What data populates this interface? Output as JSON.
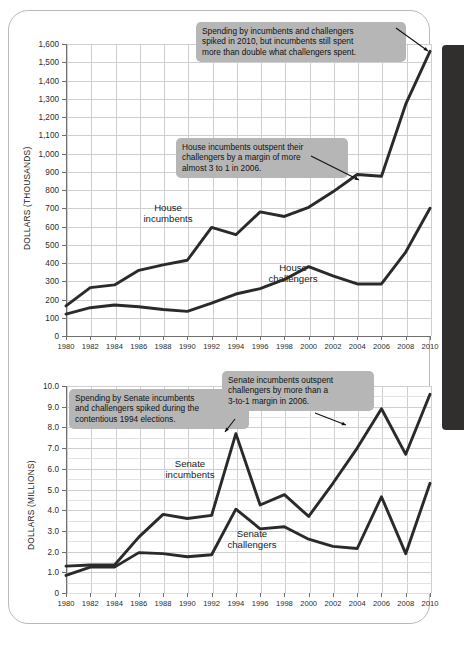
{
  "page": {
    "side_tab_color": "#302f2d",
    "card_border_color": "#b9b9b9"
  },
  "charts": [
    {
      "id": "house",
      "axis": {
        "ylabel": "DOLLARS (THOUSANDS)"
      },
      "series_labels": [
        {
          "name": "house-incumbents-label",
          "line1": "House",
          "line2": "incumbents"
        },
        {
          "name": "house-challengers-label",
          "line1": "House",
          "line2": "challengers"
        }
      ],
      "callouts": [
        {
          "name": "callout-2010-spike",
          "line1": "Spending by incumbents and challengers",
          "line2": "spiked in 2010, but incumbents still spent",
          "line3": "more than double what challengers spent."
        },
        {
          "name": "callout-house-2006-margin",
          "line1": "House incumbents outspent their",
          "line2": "challengers by a margin of more",
          "line3": "almost 3 to 1 in 2006."
        }
      ]
    },
    {
      "id": "senate",
      "axis": {
        "ylabel": "DOLLARS (MILLIONS)"
      },
      "series_labels": [
        {
          "name": "senate-incumbents-label",
          "line1": "Senate",
          "line2": "incumbents"
        },
        {
          "name": "senate-challengers-label",
          "line1": "Senate",
          "line2": "challengers"
        }
      ],
      "callouts": [
        {
          "name": "callout-senate-1994-spike",
          "line1": "Spending by Senate incumbents",
          "line2": "and challengers spiked during the",
          "line3": "contentious 1994 elections."
        },
        {
          "name": "callout-senate-2006-margin",
          "line1": "Senate incumbents outspent",
          "line2": "challengers by more than a",
          "line3": "3-to-1 margin in 2006."
        }
      ]
    }
  ],
  "chart_data": [
    {
      "type": "line",
      "title": "",
      "xlabel": "",
      "ylabel": "DOLLARS (THOUSANDS)",
      "x": [
        1980,
        1982,
        1984,
        1986,
        1988,
        1990,
        1992,
        1994,
        1996,
        1998,
        2000,
        2002,
        2004,
        2006,
        2008,
        2010
      ],
      "xtick_labels": [
        "1980",
        "1982",
        "1984",
        "1986",
        "1988",
        "1990",
        "1992",
        "1994",
        "1996",
        "1998",
        "2000",
        "2002",
        "2004",
        "2006",
        "2008",
        "2010"
      ],
      "ytick_labels": [
        "0",
        "100",
        "200",
        "300",
        "400",
        "500",
        "600",
        "700",
        "800",
        "900",
        "1,000",
        "1,100",
        "1,200",
        "1,300",
        "1,400",
        "1,500",
        "1,600"
      ],
      "ylim": [
        0,
        1600
      ],
      "ytick_step": 100,
      "grid": true,
      "legend": "inline-labels",
      "series": [
        {
          "name": "House incumbents",
          "values": [
            165,
            265,
            280,
            360,
            390,
            415,
            595,
            555,
            680,
            655,
            705,
            790,
            885,
            875,
            1270,
            1560
          ]
        },
        {
          "name": "House challengers",
          "values": [
            120,
            155,
            170,
            160,
            145,
            135,
            180,
            230,
            260,
            310,
            380,
            330,
            285,
            285,
            460,
            700
          ]
        }
      ]
    },
    {
      "type": "line",
      "title": "",
      "xlabel": "",
      "ylabel": "DOLLARS (MILLIONS)",
      "x": [
        1980,
        1982,
        1984,
        1986,
        1988,
        1990,
        1992,
        1994,
        1996,
        1998,
        2000,
        2002,
        2004,
        2006,
        2008,
        2010
      ],
      "xtick_labels": [
        "1980",
        "1982",
        "1984",
        "1986",
        "1988",
        "1990",
        "1992",
        "1994",
        "1996",
        "1998",
        "2000",
        "2002",
        "2004",
        "2006",
        "2008",
        "2010"
      ],
      "ytick_labels": [
        "0",
        "1.0",
        "2.0",
        "3.0",
        "4.0",
        "5.0",
        "6.0",
        "7.0",
        "8.0",
        "9.0",
        "10.0"
      ],
      "ylim": [
        0,
        10
      ],
      "ytick_step": 1.0,
      "minor_ytick_step": 0.5,
      "grid": true,
      "legend": "inline-labels",
      "series": [
        {
          "name": "Senate incumbents",
          "values": [
            1.3,
            1.35,
            1.35,
            2.7,
            3.8,
            3.6,
            3.75,
            7.7,
            4.25,
            4.75,
            3.7,
            5.3,
            7.0,
            8.9,
            6.7,
            9.6
          ]
        },
        {
          "name": "Senate challengers",
          "values": [
            0.85,
            1.25,
            1.25,
            1.95,
            1.9,
            1.75,
            1.85,
            4.05,
            3.1,
            3.2,
            2.6,
            2.25,
            2.15,
            4.65,
            1.9,
            5.3
          ]
        }
      ]
    }
  ]
}
